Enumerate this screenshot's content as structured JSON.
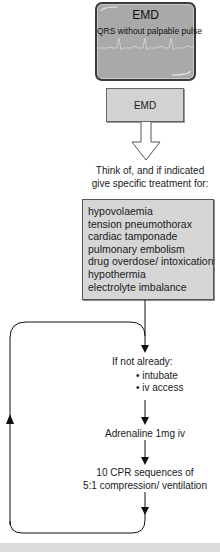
{
  "monitor": {
    "title": "EMD",
    "subtitle": "QRS without palpable pulse",
    "screen_color": "#a9a9a9"
  },
  "emd_box": {
    "label": "EMD"
  },
  "think_of": {
    "line1": "Think of, and if indicated",
    "line2": "give specific treatment for:"
  },
  "causes": [
    "hypovolaemia",
    "tension pneumothorax",
    "cardiac tamponade",
    "pulmonary embolism",
    "drug overdose/ intoxication",
    "hypothermia",
    "electrolyte imbalance"
  ],
  "if_not_already": {
    "heading": "If not already:",
    "items": [
      "intubate",
      "iv access"
    ]
  },
  "adrenaline": "Adrenaline 1mg iv",
  "cpr": {
    "line1": "10 CPR sequences of",
    "line2": "5:1 compression/ ventilation"
  },
  "colors": {
    "box_fill": "#d6d6d6",
    "line": "#111111",
    "bottom_bar": "#dcdcdc"
  }
}
